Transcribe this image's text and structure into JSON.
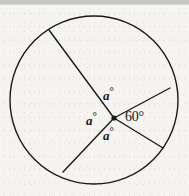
{
  "figure": {
    "name": "circle-with-four-central-angles",
    "canvas": {
      "width": 189,
      "height": 196
    },
    "background_color": "#f5f4f1",
    "ink_color": "#1a1a1c",
    "top_bar_color": "#c6c6c6"
  },
  "circle": {
    "center_x": 94,
    "center_y": 100,
    "radius": 84,
    "stroke_width": 1.4
  },
  "vertex": {
    "label": "center-point",
    "x": 114,
    "y": 118,
    "dot_radius": 2.6
  },
  "radii": [
    {
      "name": "radius-upper-left",
      "x2": 49,
      "y2": 30
    },
    {
      "name": "radius-right",
      "x2": 170,
      "y2": 88
    },
    {
      "name": "radius-lower-right",
      "x2": 163,
      "y2": 148
    },
    {
      "name": "radius-lower-left",
      "x2": 63,
      "y2": 172
    }
  ],
  "labels": {
    "angle_top": {
      "value": "a",
      "degree_symbol": "°",
      "x": 103,
      "y": 93
    },
    "angle_left": {
      "value": "a",
      "degree_symbol": "°",
      "x": 86,
      "y": 110
    },
    "angle_bottom": {
      "value": "a",
      "degree_symbol": "°",
      "x": 103,
      "y": 124
    },
    "angle_right": {
      "text": "60°",
      "x": 124,
      "y": 110
    }
  },
  "chart_data": {
    "type": "pie",
    "title": "",
    "categories": [
      "a°",
      "60°",
      "a°",
      "a°"
    ],
    "values": [
      100,
      60,
      100,
      100
    ],
    "legend": "none",
    "grid": false
  }
}
